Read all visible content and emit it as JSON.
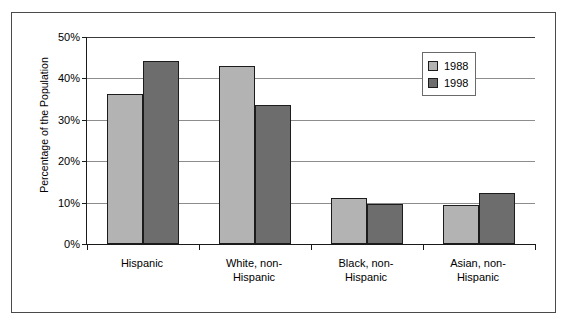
{
  "chart_data": {
    "type": "bar",
    "title": "",
    "xlabel": "",
    "ylabel": "Percentage of the Population",
    "categories": [
      "Hispanic",
      "White, non-Hispanic",
      "Black, non-Hispanic",
      "Asian, non-Hispanic"
    ],
    "category_lines": [
      [
        "Hispanic"
      ],
      [
        "White, non-",
        "Hispanic"
      ],
      [
        "Black, non-",
        "Hispanic"
      ],
      [
        "Asian, non-",
        "Hispanic"
      ]
    ],
    "series": [
      {
        "name": "1988",
        "color": "#b3b3b3",
        "values": [
          36.2,
          43.0,
          11.0,
          9.5
        ]
      },
      {
        "name": "1998",
        "color": "#6d6d6d",
        "values": [
          44.1,
          33.5,
          9.7,
          12.3
        ]
      }
    ],
    "ylim": [
      0,
      50
    ],
    "yticks": [
      0,
      10,
      20,
      30,
      40,
      50
    ],
    "ytick_labels": [
      "0%",
      "10%",
      "20%",
      "30%",
      "40%",
      "50%"
    ],
    "grid": true,
    "grid_axis": "y",
    "legend_position": "top-right",
    "legend_entries": [
      "1988",
      "1998"
    ]
  },
  "frame": {
    "border_color": "#4a4a4a",
    "background": "#ffffff"
  }
}
